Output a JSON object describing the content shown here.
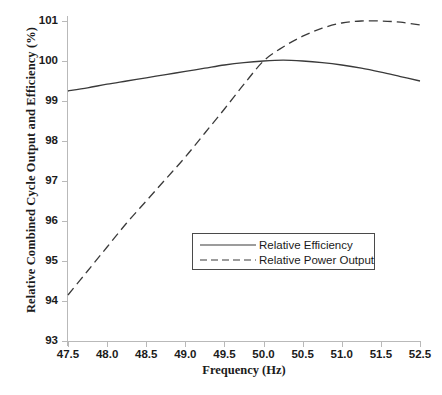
{
  "chart_data": {
    "type": "line",
    "title": "",
    "xlabel": "Frequency (Hz)",
    "ylabel": "Relative Combined Cycle Output and Efficiency (%)",
    "xlim": [
      47.5,
      52.0
    ],
    "ylim": [
      93,
      101
    ],
    "grid": false,
    "legend_position": "center",
    "xticks": [
      47.5,
      48.0,
      48.5,
      49.0,
      49.5,
      50.0,
      50.5,
      51.0,
      51.5,
      52.0
    ],
    "xtick_labels": [
      "47.5",
      "48.0",
      "48.5",
      "49.0",
      "49.5",
      "50.0",
      "50.5",
      "51.0",
      "51.5",
      "52.5"
    ],
    "yticks": [
      93,
      94,
      95,
      96,
      97,
      98,
      99,
      100,
      101
    ],
    "ytick_labels": [
      "93",
      "94",
      "95",
      "96",
      "97",
      "98",
      "99",
      "100",
      "101"
    ],
    "series": [
      {
        "name": "Relative Efficiency",
        "style": "solid",
        "color": "#3a3a3a",
        "x": [
          47.5,
          47.75,
          48.0,
          48.25,
          48.5,
          48.75,
          49.0,
          49.25,
          49.5,
          49.75,
          50.0,
          50.25,
          50.5,
          50.75,
          51.0,
          51.25,
          51.5,
          51.75,
          52.0
        ],
        "y": [
          99.25,
          99.33,
          99.42,
          99.5,
          99.58,
          99.66,
          99.74,
          99.82,
          99.9,
          99.96,
          100.0,
          100.02,
          100.0,
          99.96,
          99.9,
          99.82,
          99.72,
          99.61,
          99.5
        ]
      },
      {
        "name": "Relative Power Output",
        "style": "dashed",
        "color": "#3a3a3a",
        "x": [
          47.5,
          47.75,
          48.0,
          48.25,
          48.5,
          48.75,
          49.0,
          49.25,
          49.5,
          49.75,
          50.0,
          50.25,
          50.5,
          50.75,
          51.0,
          51.25,
          51.5,
          51.75,
          52.0
        ],
        "y": [
          94.15,
          94.75,
          95.35,
          95.95,
          96.5,
          97.05,
          97.6,
          98.2,
          98.8,
          99.42,
          100.0,
          100.35,
          100.62,
          100.82,
          100.95,
          101.0,
          101.0,
          100.97,
          100.9
        ]
      }
    ]
  },
  "legend": {
    "entries": [
      {
        "label": "Relative Efficiency",
        "style": "solid"
      },
      {
        "label": "Relative Power Output",
        "style": "dashed"
      }
    ]
  }
}
